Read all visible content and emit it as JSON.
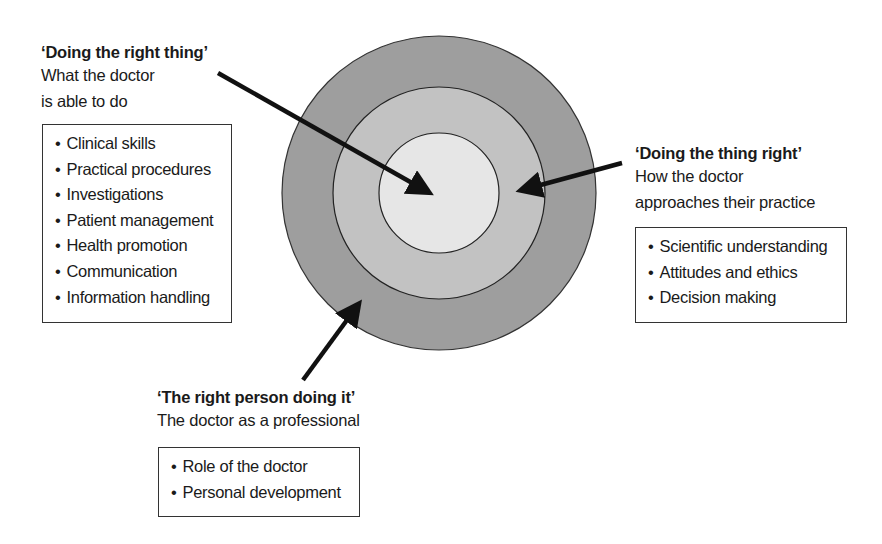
{
  "diagram": {
    "rings": [
      {
        "name": "outer",
        "fill": "#9e9e9e"
      },
      {
        "name": "middle",
        "fill": "#c0c0c0"
      },
      {
        "name": "inner",
        "fill": "#e4e4e4"
      }
    ]
  },
  "left": {
    "title": "‘Doing the right thing’",
    "subtitle_line1": "What the doctor",
    "subtitle_line2": "is able to do",
    "items": [
      "Clinical skills",
      "Practical procedures",
      "Investigations",
      "Patient management",
      "Health promotion",
      "Communication",
      "Information handling"
    ]
  },
  "right": {
    "title": "‘Doing the thing right’",
    "subtitle_line1": "How the doctor",
    "subtitle_line2": "approaches their practice",
    "items": [
      "Scientific understanding",
      "Attitudes and ethics",
      "Decision making"
    ]
  },
  "bottom": {
    "title": "‘The right person doing it’",
    "subtitle_line1": "The doctor as a professional",
    "items": [
      "Role of the doctor",
      "Personal development"
    ]
  }
}
